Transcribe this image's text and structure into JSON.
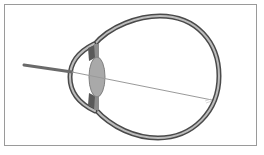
{
  "diagram": {
    "type": "eye-cross-section",
    "parts": [
      {
        "name": "sclera-wall",
        "label": ""
      },
      {
        "name": "cornea",
        "label": ""
      },
      {
        "name": "iris-upper",
        "label": ""
      },
      {
        "name": "iris-lower",
        "label": ""
      },
      {
        "name": "lens",
        "label": ""
      },
      {
        "name": "light-ray",
        "label": ""
      }
    ],
    "colors": {
      "frame_border": "#9a9a9a",
      "wall_outer": "#4a4a4a",
      "wall_inner": "#b8b8b8",
      "iris": "#5a5a5a",
      "lens_fill": "#a9a9a9",
      "lens_stroke": "#808080",
      "ray_outside": "#6a6a6a",
      "ray_inside": "#9a9a9a"
    }
  }
}
